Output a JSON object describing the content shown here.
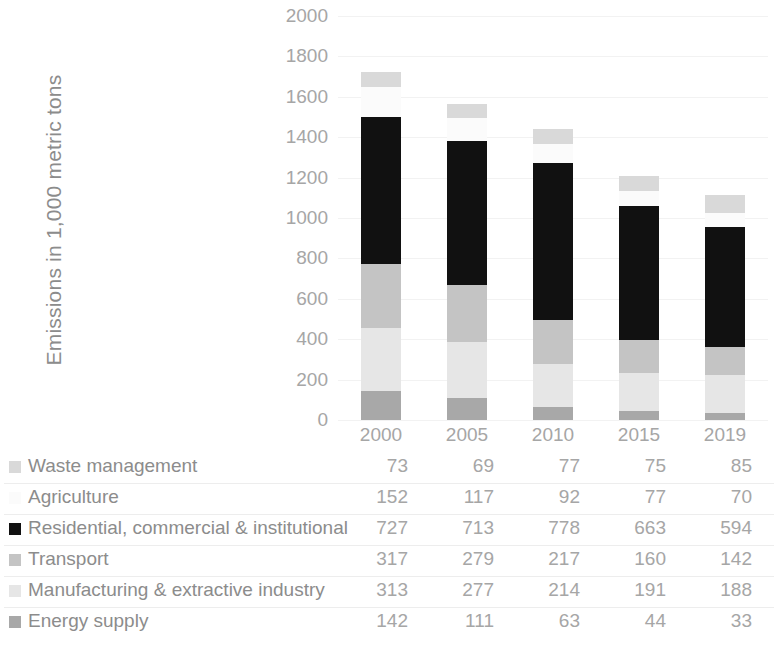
{
  "chart_data": {
    "type": "bar",
    "subtype": "stacked-column",
    "title": "",
    "xlabel": "",
    "ylabel": "Emissions in 1,000 metric tons",
    "categories": [
      "2000",
      "2005",
      "2010",
      "2015",
      "2019"
    ],
    "ylim": [
      0,
      2000
    ],
    "ytick_step": 200,
    "yticks": [
      "2000",
      "1800",
      "1600",
      "1400",
      "1200",
      "1000",
      "800",
      "600",
      "400",
      "200",
      "0"
    ],
    "grid": true,
    "legend_position": "table-left",
    "stack_order_bottom_to_top": [
      "Energy supply",
      "Manufacturing & extractive industry",
      "Transport",
      "Residential, commercial & institutional",
      "Agriculture",
      "Waste management"
    ],
    "series": [
      {
        "name": "Waste management",
        "color": "#d9d9d9",
        "values": [
          73,
          69,
          77,
          75,
          85
        ]
      },
      {
        "name": "Agriculture",
        "color": "#fbfbfb",
        "values": [
          152,
          117,
          92,
          77,
          70
        ]
      },
      {
        "name": "Residential, commercial & institutional",
        "color": "#111111",
        "values": [
          727,
          713,
          778,
          663,
          594
        ]
      },
      {
        "name": "Transport",
        "color": "#c4c4c4",
        "values": [
          317,
          279,
          217,
          160,
          142
        ]
      },
      {
        "name": "Manufacturing & extractive industry",
        "color": "#e6e6e6",
        "values": [
          313,
          277,
          214,
          191,
          188
        ]
      },
      {
        "name": "Energy supply",
        "color": "#a8a8a8",
        "values": [
          142,
          111,
          63,
          44,
          33
        ]
      }
    ],
    "totals": [
      1724,
      1566,
      1441,
      1210,
      1112
    ]
  },
  "table": {
    "columns": [
      "2000",
      "2005",
      "2010",
      "2015",
      "2019"
    ],
    "rows": [
      {
        "label": "Waste management",
        "swatch": "#d9d9d9",
        "values": [
          "73",
          "69",
          "77",
          "75",
          "85"
        ]
      },
      {
        "label": "Agriculture",
        "swatch": "#fbfbfb",
        "values": [
          "152",
          "117",
          "92",
          "77",
          "70"
        ]
      },
      {
        "label": "Residential, commercial & institutional",
        "swatch": "#111111",
        "values": [
          "727",
          "713",
          "778",
          "663",
          "594"
        ]
      },
      {
        "label": "Transport",
        "swatch": "#c4c4c4",
        "values": [
          "317",
          "279",
          "217",
          "160",
          "142"
        ]
      },
      {
        "label": "Manufacturing & extractive industry",
        "swatch": "#e6e6e6",
        "values": [
          "313",
          "277",
          "214",
          "191",
          "188"
        ]
      },
      {
        "label": "Energy supply",
        "swatch": "#a8a8a8",
        "values": [
          "142",
          "111",
          "63",
          "44",
          "33"
        ]
      }
    ]
  }
}
